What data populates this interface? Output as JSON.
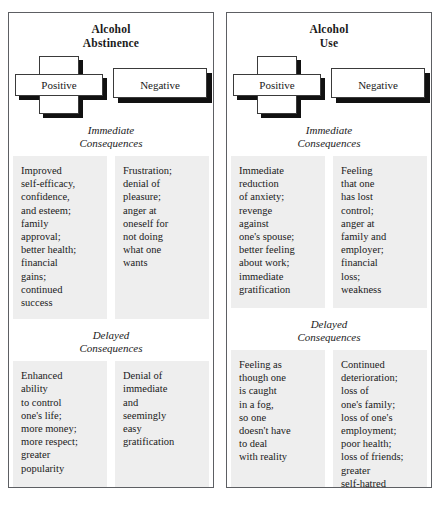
{
  "panels": [
    {
      "title": "Alcohol\nAbstinence",
      "positive_label": "Positive",
      "negative_label": "Negative",
      "immediate_heading": "Immediate\nConsequences",
      "delayed_heading": "Delayed\nConsequences",
      "immediate_positive": "Improved\nself-efficacy,\nconfidence,\nand esteem;\nfamily\napproval;\nbetter health;\nfinancial\ngains;\ncontinued\nsuccess",
      "immediate_negative": "Frustration;\ndenial of\npleasure;\nanger at\noneself for\nnot doing\nwhat one\nwants",
      "delayed_positive": "Enhanced\nability\nto control\none's life;\nmore money;\nmore respect;\ngreater\npopularity",
      "delayed_negative": "Denial of\nimmediate\nand\nseemingly\neasy\ngratification"
    },
    {
      "title": "Alcohol\nUse",
      "positive_label": "Positive",
      "negative_label": "Negative",
      "immediate_heading": "Immediate\nConsequences",
      "delayed_heading": "Delayed\nConsequences",
      "immediate_positive": "Immediate\nreduction\nof anxiety;\nrevenge\nagainst\none's spouse;\nbetter feeling\nabout work;\nimmediate\ngratification",
      "immediate_negative": "Feeling\nthat one\nhas lost\ncontrol;\nanger at\nfamily and\nemployer;\nfinancial\nloss;\nweakness",
      "delayed_positive": "Feeling as\nthough one\nis caught\nin a fog,\nso one\ndoesn't have\nto deal\nwith reality",
      "delayed_negative": "Continued\ndeterioration;\nloss of\none's family;\nloss of one's\nemployment;\npoor health;\nloss of friends;\ngreater\nself-hatred"
    }
  ],
  "colors": {
    "cell_background": "#eeeeee",
    "panel_border": "#5d5f63",
    "shadow": "#111111",
    "text": "#1a1a1a"
  }
}
